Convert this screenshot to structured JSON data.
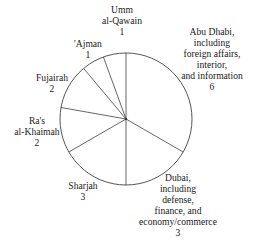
{
  "chart_data": {
    "type": "pie",
    "title": "",
    "start_angle_deg": 0,
    "direction": "clockwise",
    "total": 18,
    "slices": [
      {
        "name": "Abu Dhabi",
        "label_lines": [
          "Abu Dhabi,",
          "including",
          "foreign affairs,",
          "interior,",
          "and information"
        ],
        "value": 6
      },
      {
        "name": "Dubai",
        "label_lines": [
          "Dubai,",
          "including",
          "defense,",
          "finance, and",
          "economy/commerce"
        ],
        "value": 3
      },
      {
        "name": "Sharjah",
        "label_lines": [
          "Sharjah"
        ],
        "value": 3
      },
      {
        "name": "Ra's al-Khaimah",
        "label_lines": [
          "Ra's",
          "al-Khaimah"
        ],
        "value": 2
      },
      {
        "name": "Fujairah",
        "label_lines": [
          "Fujairah"
        ],
        "value": 2
      },
      {
        "name": "'Ajman",
        "label_lines": [
          "'Ajman"
        ],
        "value": 1
      },
      {
        "name": "Umm al-Qawain",
        "label_lines": [
          "Umm",
          "al-Qawain"
        ],
        "value": 1
      }
    ],
    "style": {
      "fill": "#ffffff",
      "stroke": "#555555"
    }
  },
  "labels": {
    "abu_dhabi": {
      "l1": "Abu Dhabi,",
      "l2": "including",
      "l3": "foreign affairs,",
      "l4": "interior,",
      "l5": "and information",
      "value": "6"
    },
    "dubai": {
      "l1": "Dubai,",
      "l2": "including",
      "l3": "defense,",
      "l4": "finance, and",
      "l5": "economy/commerce",
      "value": "3"
    },
    "sharjah": {
      "l1": "Sharjah",
      "value": "3"
    },
    "ras_al_khaimah": {
      "l1": "Ra's",
      "l2": "al-Khaimah",
      "value": "2"
    },
    "fujairah": {
      "l1": "Fujairah",
      "value": "2"
    },
    "ajman": {
      "l1": "'Ajman",
      "value": "1"
    },
    "umm_al_qawain": {
      "l1": "Umm",
      "l2": "al-Qawain",
      "value": "1"
    }
  }
}
